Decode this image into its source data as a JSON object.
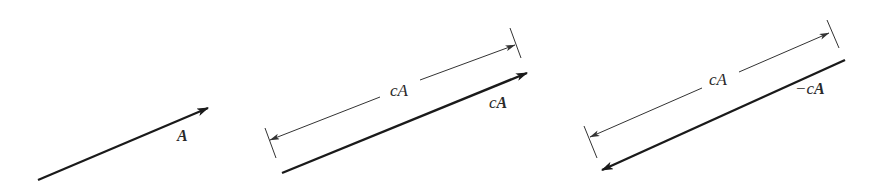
{
  "figure": {
    "panels": [
      {
        "id": "vector-a",
        "vector_label_prefix": "",
        "vector_label_bold": "A"
      },
      {
        "id": "vector-ca",
        "dimension_label": "cA",
        "vector_label_prefix": "c",
        "vector_label_bold": "A"
      },
      {
        "id": "vector-neg-ca",
        "dimension_label": "cA",
        "vector_label_prefix": "−c",
        "vector_label_bold": "A"
      }
    ],
    "colors": {
      "line": "#1a1a1a",
      "thin_line": "#333333",
      "background": "#ffffff"
    }
  }
}
